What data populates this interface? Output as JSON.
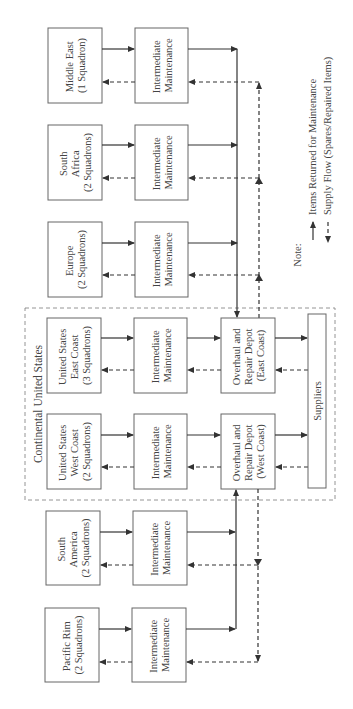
{
  "diagram": {
    "orientation": "rotated-90-ccw",
    "region": {
      "label": "Continental United States"
    },
    "squadrons": [
      {
        "id": "middle-east",
        "lines": [
          "Middle East",
          "(1 Squadron)"
        ]
      },
      {
        "id": "south-africa",
        "lines": [
          "South",
          "Africa",
          "(2 Squadrons)"
        ]
      },
      {
        "id": "europe",
        "lines": [
          "Europe",
          "(2 Squadrons)"
        ]
      },
      {
        "id": "us-east",
        "lines": [
          "United States",
          "East Coast",
          "(3 Squadrons)"
        ]
      },
      {
        "id": "us-west",
        "lines": [
          "United States",
          "West Coast",
          "(2 Squadrons)"
        ]
      },
      {
        "id": "south-america",
        "lines": [
          "South",
          "America",
          "(2 Squadrons)"
        ]
      },
      {
        "id": "pacific-rim",
        "lines": [
          "Pacific Rim",
          "(2 Squadrons)"
        ]
      }
    ],
    "intermediate": {
      "lines": [
        "Intermediate",
        "Maintenance"
      ]
    },
    "depots": [
      {
        "id": "depot-east",
        "lines": [
          "Overhaul and",
          "Repair Depot",
          "(East Coast)"
        ]
      },
      {
        "id": "depot-west",
        "lines": [
          "Overhaul and",
          "Repair Depot",
          "(West Coast)"
        ]
      }
    ],
    "suppliers": {
      "label": "Suppliers"
    },
    "legend": {
      "title": "Note:",
      "items": [
        {
          "style": "solid",
          "label": "Items Returned for Maintenance"
        },
        {
          "style": "dashed",
          "label": "Supply Flow (Spares/Repaired Items)"
        }
      ]
    },
    "colors": {
      "line": "#333333",
      "box_border": "#666666",
      "region_border": "#888888",
      "text": "#444444"
    }
  }
}
